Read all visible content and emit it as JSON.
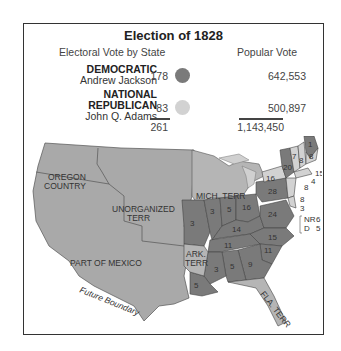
{
  "title": "Election of 1828",
  "headers": {
    "electoral": "Electoral Vote by State",
    "popular": "Popular Vote"
  },
  "candidates": [
    {
      "party": "DEMOCRATIC",
      "name": "Andrew Jackson",
      "electoral": "178",
      "popular": "642,553",
      "color": "#7a7a7a"
    },
    {
      "party_line1": "NATIONAL",
      "party_line2": "REPUBLICAN",
      "name": "John Q. Adams",
      "electoral": "83",
      "popular": "500,897",
      "color": "#d2d2d2"
    }
  ],
  "totals": {
    "electoral": "261",
    "popular": "1,143,450"
  },
  "map": {
    "territories": {
      "oregon_1": "OREGON",
      "oregon_2": "COUNTRY",
      "unorg_1": "UNORGANIZED",
      "unorg_2": "TERR",
      "mexico": "PART OF MEXICO",
      "mich": "MICH. TERR",
      "ark_1": "ARK.",
      "ark_2": "TERR",
      "fla": "FLA. TERR",
      "future": "Future Boundary"
    },
    "state_votes": {
      "maine_j": "1",
      "maine_a": "8",
      "nh": "8",
      "vt": "7",
      "ny": "20",
      "ny_a": "16",
      "ma": "15",
      "ri": "4",
      "ct": "8",
      "nj": "8",
      "de": "3",
      "md_label": "NR",
      "md_nr": "6",
      "md_d_label": "D",
      "md_d": "5",
      "pa": "28",
      "oh": "16",
      "in": "5",
      "il": "3",
      "mo": "3",
      "ky": "14",
      "va": "24",
      "nc": "15",
      "tn": "11",
      "sc": "11",
      "ga": "9",
      "al": "5",
      "ms": "3",
      "la": "5"
    }
  },
  "colors": {
    "democratic": "#7a7a7a",
    "national_republican": "#d2d2d2",
    "territory": "#a9a9a9",
    "lakes": "#c8c8c8"
  }
}
